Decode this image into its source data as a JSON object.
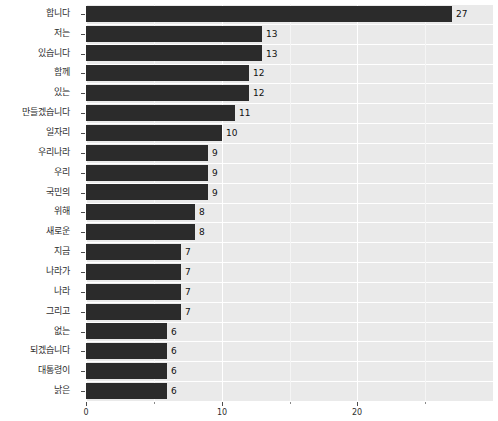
{
  "chart_data": {
    "type": "bar",
    "orientation": "horizontal",
    "title": "",
    "xlabel": "",
    "ylabel": "",
    "xlim": [
      0,
      30
    ],
    "xticks": [
      0,
      10,
      20
    ],
    "xtick_labels": [
      "0",
      "10",
      "20"
    ],
    "grid": true,
    "legend": "none",
    "bar_color": "#2b2b2b",
    "panel_color": "#eaeaea",
    "gridline_color": "#ffffff",
    "categories": [
      "합니다",
      "저는",
      "있습니다",
      "함께",
      "있는",
      "만들겠습니다",
      "일자리",
      "우리나라",
      "우리",
      "국민의",
      "위해",
      "새로운",
      "지금",
      "나라가",
      "나라",
      "그리고",
      "없는",
      "되겠습니다",
      "대통령이",
      "낡은"
    ],
    "values": [
      27,
      13,
      13,
      12,
      12,
      11,
      10,
      9,
      9,
      9,
      8,
      8,
      7,
      7,
      7,
      7,
      6,
      6,
      6,
      6
    ],
    "value_labels": [
      "27",
      "13",
      "13",
      "12",
      "12",
      "11",
      "10",
      "9",
      "9",
      "9",
      "8",
      "8",
      "7",
      "7",
      "7",
      "7",
      "6",
      "6",
      "6",
      "6"
    ]
  }
}
